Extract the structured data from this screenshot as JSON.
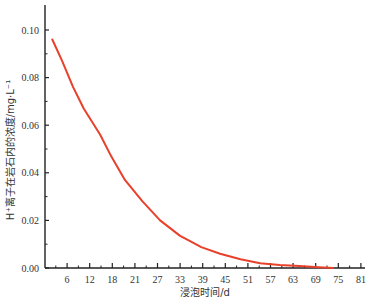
{
  "chart_data": {
    "type": "line",
    "title": "",
    "xlabel": "浸泡时间/d",
    "ylabel": "H⁺离子在岩石内的浓度/mg·L⁻¹",
    "xlim": [
      0,
      81
    ],
    "ylim": [
      0,
      0.105
    ],
    "x_ticks": [
      6,
      12,
      18,
      21,
      27,
      33,
      39,
      45,
      51,
      57,
      63,
      69,
      75,
      81
    ],
    "x_tick_positions": [
      6,
      12,
      18,
      24,
      30,
      36,
      42,
      48,
      54,
      60,
      66,
      72,
      78,
      84
    ],
    "y_ticks": [
      "0.00",
      "0.02",
      "0.04",
      "0.06",
      "0.08",
      "0.10"
    ],
    "grid": false,
    "legend": null,
    "series": [
      {
        "name": "H⁺ concentration",
        "color": "#e8402a",
        "x": [
          2,
          4.5,
          7.3,
          10,
          14.2,
          17,
          20.5,
          25,
          29.5,
          34.6,
          36.3,
          40,
          44.8,
          50,
          55,
          60,
          65,
          70,
          73.6
        ],
        "y": [
          0.096,
          0.087,
          0.076,
          0.067,
          0.056,
          0.047,
          0.037,
          0.028,
          0.02,
          0.0135,
          0.012,
          0.0088,
          0.006,
          0.0037,
          0.002,
          0.0012,
          0.0008,
          0.0003,
          0.0
        ]
      }
    ]
  }
}
